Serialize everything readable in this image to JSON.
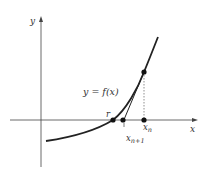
{
  "figure": {
    "y_axis_label": "y",
    "x_axis_label": "x",
    "curve_label": "y = f(x)",
    "root_label": "r",
    "xn_label": "x",
    "xn_sub": "n",
    "xn1_label": "x",
    "xn1_sub": "n+1"
  },
  "colors": {
    "stroke": "#222222",
    "text": "#333333"
  }
}
